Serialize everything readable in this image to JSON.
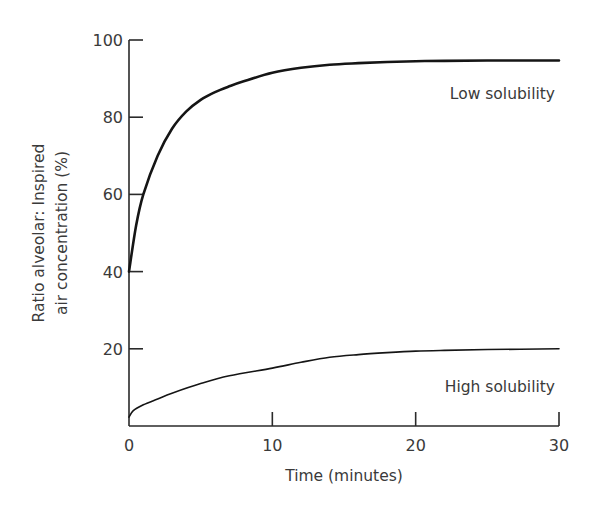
{
  "chart_data": {
    "type": "line",
    "title": "",
    "xlabel": "Time (minutes)",
    "ylabel_lines": [
      "Ratio alveolar: Inspired",
      "air concentration (%)"
    ],
    "ylabel": "Ratio alveolar: Inspired air concentration (%)",
    "xlim": [
      0,
      30
    ],
    "ylim": [
      0,
      100
    ],
    "x_ticks": [
      0,
      10,
      20,
      30
    ],
    "x_tick_labels": [
      "0",
      "10",
      "20",
      "30"
    ],
    "y_ticks": [
      20,
      40,
      60,
      80,
      100
    ],
    "y_tick_labels": [
      "20",
      "40",
      "60",
      "80",
      "100"
    ],
    "grid": false,
    "legend": "inline labels",
    "series": [
      {
        "name": "Low solubility",
        "label_position": {
          "x": 30,
          "y": 86
        },
        "x": [
          0,
          0.5,
          1,
          2,
          3,
          4,
          5,
          6,
          7,
          8,
          10,
          12,
          14,
          16,
          18,
          20,
          22,
          25,
          30
        ],
        "values": [
          40,
          52,
          60,
          70,
          77,
          81.5,
          84.5,
          86.5,
          88,
          89.3,
          91.5,
          92.8,
          93.6,
          94,
          94.3,
          94.5,
          94.6,
          94.7,
          94.7
        ]
      },
      {
        "name": "High solubility",
        "label_position": {
          "x": 30,
          "y": 10
        },
        "x": [
          0,
          0.3,
          1,
          2,
          3,
          5,
          7,
          10,
          12,
          14,
          16,
          18,
          20,
          22,
          25,
          30
        ],
        "values": [
          2.3,
          4,
          5.5,
          7,
          8.5,
          11,
          13,
          15,
          16.5,
          17.8,
          18.5,
          19,
          19.4,
          19.6,
          19.8,
          20
        ]
      }
    ]
  }
}
